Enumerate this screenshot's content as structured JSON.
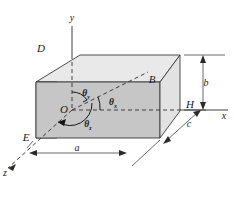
{
  "figure": {
    "points": [
      {
        "id": "point-D",
        "label": "D",
        "x": 41,
        "y": 48
      },
      {
        "id": "point-B",
        "label": "B",
        "x": 150,
        "y": 79
      },
      {
        "id": "point-H",
        "label": "H",
        "x": 188,
        "y": 109
      },
      {
        "id": "point-E",
        "label": "E",
        "x": 33,
        "y": 137
      },
      {
        "id": "point-O",
        "label": "O",
        "x": 67,
        "y": 110
      }
    ],
    "axes": [
      {
        "id": "axis-y",
        "label": "y",
        "x": 72,
        "y": 18
      },
      {
        "id": "axis-x",
        "label": "x",
        "x": 222,
        "y": 117
      },
      {
        "id": "axis-z",
        "label": "z",
        "x": 4,
        "y": 172
      }
    ],
    "angles": [
      {
        "id": "angle-theta-y",
        "symbol": "θ",
        "subscript": "y",
        "x": 89,
        "y": 95
      },
      {
        "id": "angle-theta-x",
        "symbol": "θ",
        "subscript": "x",
        "x": 113,
        "y": 106
      },
      {
        "id": "angle-theta-z",
        "symbol": "θ",
        "subscript": "z",
        "x": 90,
        "y": 124
      }
    ],
    "dimensions": [
      {
        "id": "dimension-a",
        "label": "a",
        "x": 76,
        "y": 155
      },
      {
        "id": "dimension-b",
        "label": "b",
        "x": 205,
        "y": 85
      },
      {
        "id": "dimension-c",
        "label": "c",
        "x": 188,
        "y": 126
      }
    ],
    "colors": {
      "top_face": "#e9e9e9",
      "left_face": "#c9c9c9",
      "front_face": "#c6c6c6",
      "right_face": "#e2e2e2",
      "edge": "#3a3a3a",
      "background": "#ffffff"
    }
  }
}
